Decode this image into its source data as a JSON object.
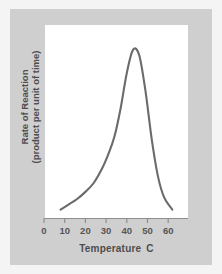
{
  "chart_data": {
    "type": "line",
    "title": "",
    "xlabel": "Temperature",
    "xunit": "C",
    "ylabel_line1": "Rate of Reaction",
    "ylabel_line2": "(product per unit of time)",
    "xticks": [
      "0",
      "10",
      "20",
      "30",
      "40",
      "50",
      "60"
    ],
    "xtick_values": [
      0,
      10,
      20,
      30,
      40,
      50,
      60
    ],
    "xlim": [
      0,
      65
    ],
    "ylim": [
      0,
      1
    ],
    "yticks": [],
    "grid": false,
    "legend": null,
    "series": [
      {
        "name": "Rate of Reaction",
        "x": [
          8,
          12,
          16,
          20,
          24,
          28,
          31,
          34,
          37,
          40,
          43,
          46,
          49,
          52,
          55,
          58,
          62
        ],
        "values": [
          0.05,
          0.08,
          0.11,
          0.15,
          0.2,
          0.28,
          0.36,
          0.46,
          0.62,
          0.82,
          0.95,
          0.92,
          0.72,
          0.45,
          0.24,
          0.12,
          0.05
        ],
        "color": "#6b6b6b",
        "peak_x": 43,
        "peak_y": 0.95
      }
    ],
    "annotations": []
  },
  "figure": {
    "background_color": "#f4f4f4",
    "panel_color": "#cfcfcf",
    "plot_background": "#ffffff",
    "axis_color": "#8e8e8e",
    "text_color": "#4d4d4d"
  }
}
